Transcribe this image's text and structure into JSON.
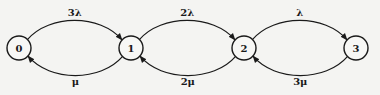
{
  "diagram": {
    "type": "birth-death state transition diagram",
    "nodes": [
      {
        "id": "0",
        "label": "0"
      },
      {
        "id": "1",
        "label": "1"
      },
      {
        "id": "2",
        "label": "2"
      },
      {
        "id": "3",
        "label": "3"
      }
    ],
    "edges": [
      {
        "from": "0",
        "to": "1",
        "label": "3λ",
        "direction": "forward"
      },
      {
        "from": "1",
        "to": "2",
        "label": "2λ",
        "direction": "forward"
      },
      {
        "from": "2",
        "to": "3",
        "label": "λ",
        "direction": "forward"
      },
      {
        "from": "1",
        "to": "0",
        "label": "μ",
        "direction": "backward"
      },
      {
        "from": "2",
        "to": "1",
        "label": "2μ",
        "direction": "backward"
      },
      {
        "from": "3",
        "to": "2",
        "label": "3μ",
        "direction": "backward"
      }
    ]
  }
}
